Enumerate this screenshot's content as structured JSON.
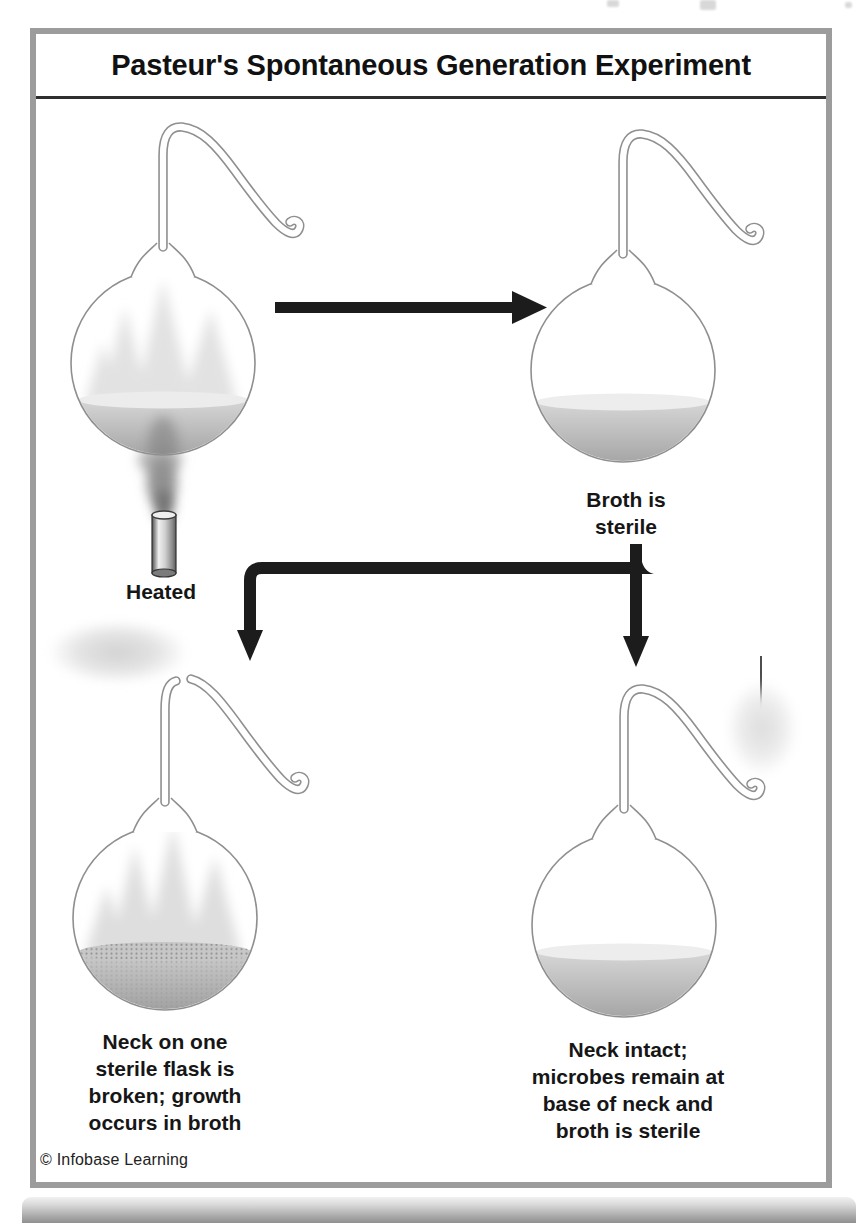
{
  "header": {
    "title": "Pasteur's Spontaneous Generation Experiment"
  },
  "diagram": {
    "heated_label": "Heated",
    "sterile_label": "Broth is\nsterile",
    "broken_label": "Neck on one\nsterile flask is\nbroken; growth\noccurs in broth",
    "intact_label": "Neck intact;\nmicrobes remain at\nbase of neck and\nbroth is sterile"
  },
  "footer": {
    "credit": "© Infobase Learning"
  },
  "colors": {
    "frame_border": "#9c9c9c",
    "title_rule": "#2e2e2e",
    "arrow": "#1c1c1c",
    "glass_outline": "#8f8f8f",
    "broth_light": "#d6d6d6",
    "broth_dark": "#a2a2a2"
  }
}
